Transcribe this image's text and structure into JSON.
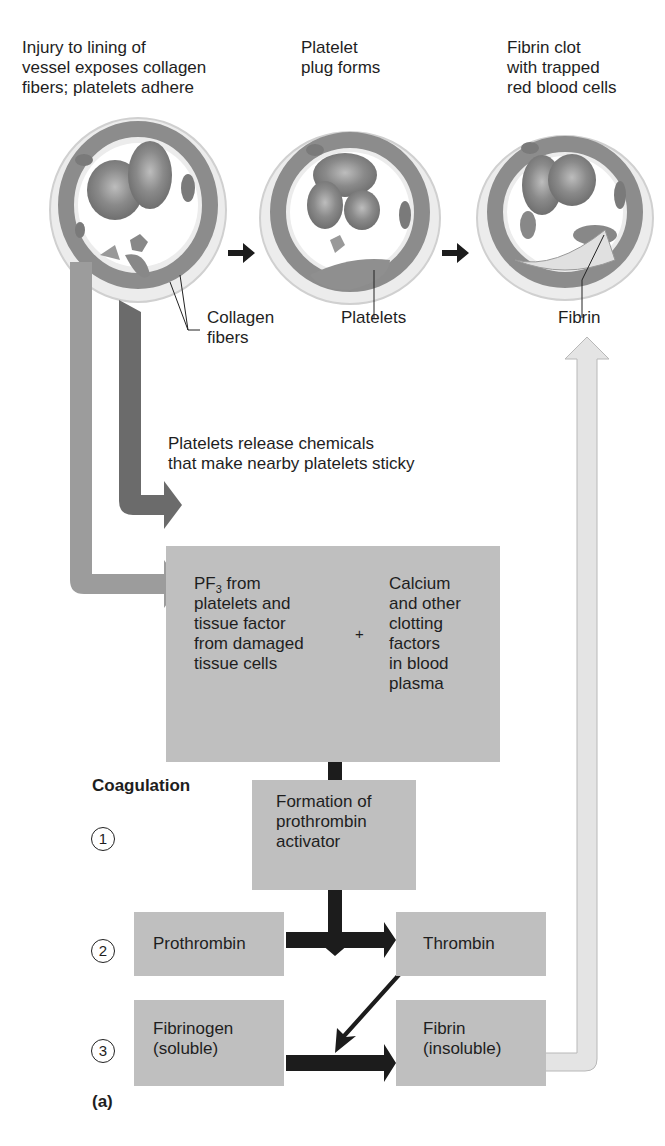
{
  "figure": {
    "panel_label": "(a)",
    "stages": [
      {
        "id": "injury",
        "caption": [
          "Injury to lining of",
          "vessel exposes collagen",
          "fibers; platelets adhere"
        ],
        "callout": [
          "Collagen",
          "fibers"
        ]
      },
      {
        "id": "plug",
        "caption": [
          "Platelet",
          "plug forms"
        ],
        "callout": [
          "Platelets"
        ]
      },
      {
        "id": "clot",
        "caption": [
          "Fibrin clot",
          "with trapped",
          "red blood cells"
        ],
        "callout": [
          "Fibrin"
        ]
      }
    ],
    "release_note": [
      "Platelets release chemicals",
      "that make nearby platelets sticky"
    ],
    "factors_box": {
      "left": {
        "pf_prefix": "PF",
        "pf_sub": "3",
        "pf_suffix": " from",
        "lines": [
          "platelets and",
          "tissue factor",
          "from damaged",
          "tissue cells"
        ]
      },
      "plus": "+",
      "right": [
        "Calcium",
        "and other",
        "clotting",
        "factors",
        "in blood",
        "plasma"
      ]
    },
    "coagulation": {
      "title": "Coagulation",
      "steps": [
        {
          "num": "1",
          "boxes": [
            [
              "Formation of",
              "prothrombin",
              "activator"
            ]
          ]
        },
        {
          "num": "2",
          "boxes": [
            [
              "Prothrombin"
            ],
            [
              "Thrombin"
            ]
          ]
        },
        {
          "num": "3",
          "boxes": [
            [
              "Fibrinogen",
              "(soluble)"
            ],
            [
              "Fibrin",
              "(insoluble)"
            ]
          ]
        }
      ]
    },
    "colors": {
      "box": "#bfbfbf",
      "arrow_light": "#9c9c9c",
      "arrow_dark": "#6b6b6b",
      "arrow_black": "#1c1c1c",
      "arrow_feedback": "#e4e4e4"
    }
  }
}
